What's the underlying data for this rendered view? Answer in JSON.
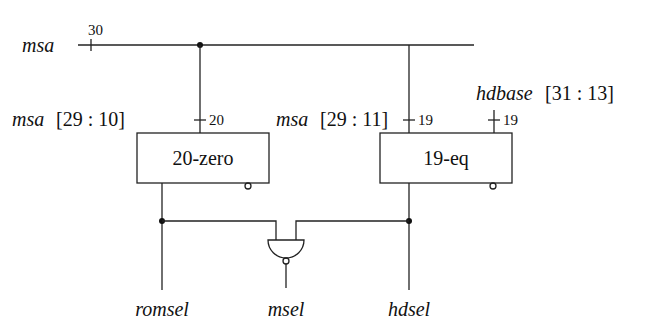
{
  "signals": {
    "input_bus": {
      "name": "msa",
      "width": "30"
    },
    "zero_input": {
      "name": "msa",
      "range": "[29 : 10]",
      "width": "20"
    },
    "eq_input_a": {
      "name": "msa",
      "range": "[29 : 11]",
      "width": "19"
    },
    "eq_input_b": {
      "name": "hdbase",
      "range": "[31 : 13]",
      "width": "19"
    },
    "outputs": {
      "left": "romsel",
      "middle": "msel",
      "right": "hdsel"
    }
  },
  "blocks": {
    "zero": {
      "label": "20-zero"
    },
    "eq": {
      "label": "19-eq"
    }
  }
}
